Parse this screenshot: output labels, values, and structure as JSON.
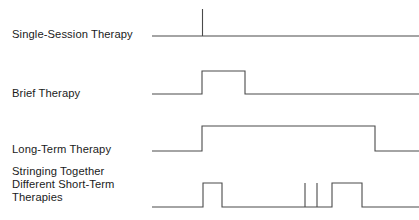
{
  "figure": {
    "background_color": "#ffffff",
    "stroke_color": "#4a4a4a",
    "text_color": "#1b1b1b",
    "rows": [
      {
        "id": "single-session-therapy",
        "label": "Single-Session Therapy",
        "label_lines": [
          "Single-Session Therapy"
        ],
        "baseline_y": 36,
        "high_y": 9,
        "x_start": 152,
        "x_end": 419,
        "pulses": [
          {
            "start": 202.5,
            "end": 202.5,
            "kind": "spike"
          }
        ]
      },
      {
        "id": "brief-therapy",
        "label": "Brief Therapy",
        "label_lines": [
          "Brief Therapy"
        ],
        "baseline_y": 94,
        "high_y": 71,
        "x_start": 152,
        "x_end": 419,
        "pulses": [
          {
            "start": 202,
            "end": 245,
            "kind": "block"
          }
        ]
      },
      {
        "id": "long-term-therapy",
        "label": "Long-Term Therapy",
        "label_lines": [
          "Long-Term Therapy"
        ],
        "baseline_y": 151,
        "high_y": 126,
        "x_start": 152,
        "x_end": 419,
        "pulses": [
          {
            "start": 202,
            "end": 375,
            "kind": "block"
          }
        ]
      },
      {
        "id": "stringing-together-different-short-term-therapies",
        "label": "Stringing Together Different Short-Term Therapies",
        "label_lines": [
          "Stringing Together",
          "Different Short-Term",
          "Therapies"
        ],
        "baseline_y": 207,
        "high_y": 183,
        "x_start": 152,
        "x_end": 419,
        "pulses": [
          {
            "start": 203,
            "end": 222,
            "kind": "block"
          },
          {
            "start": 305,
            "end": 305,
            "kind": "spike"
          },
          {
            "start": 317,
            "end": 317,
            "kind": "spike"
          },
          {
            "start": 332,
            "end": 362,
            "kind": "block"
          }
        ]
      }
    ]
  },
  "chart_data": {
    "type": "line",
    "title": "",
    "xlabel": "",
    "ylabel": "",
    "categories": [
      "Single-Session Therapy",
      "Brief Therapy",
      "Long-Term Therapy",
      "Stringing Together Different Short-Term Therapies"
    ],
    "series": [
      {
        "name": "Single-Session Therapy",
        "segments": [
          {
            "type": "baseline",
            "x0": 152,
            "x1": 419
          },
          {
            "type": "spike",
            "x": 202.5
          }
        ]
      },
      {
        "name": "Brief Therapy",
        "segments": [
          {
            "type": "baseline",
            "x0": 152,
            "x1": 202
          },
          {
            "type": "high",
            "x0": 202,
            "x1": 245
          },
          {
            "type": "baseline",
            "x0": 245,
            "x1": 419
          }
        ]
      },
      {
        "name": "Long-Term Therapy",
        "segments": [
          {
            "type": "baseline",
            "x0": 152,
            "x1": 202
          },
          {
            "type": "high",
            "x0": 202,
            "x1": 375
          },
          {
            "type": "baseline",
            "x0": 375,
            "x1": 419
          }
        ]
      },
      {
        "name": "Stringing Together Different Short-Term Therapies",
        "segments": [
          {
            "type": "baseline",
            "x0": 152,
            "x1": 203
          },
          {
            "type": "high",
            "x0": 203,
            "x1": 222
          },
          {
            "type": "baseline",
            "x0": 222,
            "x1": 305
          },
          {
            "type": "spike",
            "x": 305
          },
          {
            "type": "spike",
            "x": 317
          },
          {
            "type": "baseline",
            "x0": 317,
            "x1": 332
          },
          {
            "type": "high",
            "x0": 332,
            "x1": 362
          },
          {
            "type": "baseline",
            "x0": 362,
            "x1": 419
          }
        ]
      }
    ],
    "grid": false,
    "legend": "none"
  }
}
